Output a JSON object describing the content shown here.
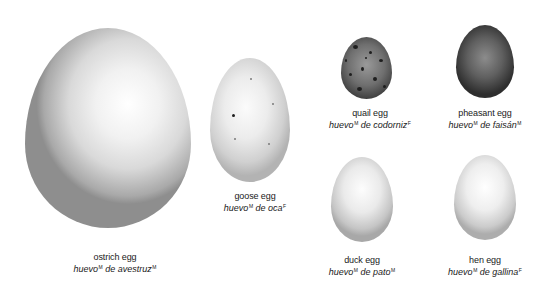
{
  "eggs": [
    {
      "id": "ostrich",
      "en": "ostrich egg",
      "es_noun": "huevo",
      "es_noun_gender": "M",
      "es_rest": " de avestruz",
      "es_rest_gender": "M"
    },
    {
      "id": "goose",
      "en": "goose egg",
      "es_noun": "huevo",
      "es_noun_gender": "M",
      "es_rest": " de oca",
      "es_rest_gender": "F"
    },
    {
      "id": "quail",
      "en": "quail egg",
      "es_noun": "huevo",
      "es_noun_gender": "M",
      "es_rest": " de codorniz",
      "es_rest_gender": "F"
    },
    {
      "id": "pheasant",
      "en": "pheasant egg",
      "es_noun": "huevo",
      "es_noun_gender": "M",
      "es_rest": " de faisán",
      "es_rest_gender": "M"
    },
    {
      "id": "duck",
      "en": "duck egg",
      "es_noun": "huevo",
      "es_noun_gender": "M",
      "es_rest": " de pato",
      "es_rest_gender": "M"
    },
    {
      "id": "hen",
      "en": "hen egg",
      "es_noun": "huevo",
      "es_noun_gender": "M",
      "es_rest": " de gallina",
      "es_rest_gender": "F"
    }
  ],
  "colors": {
    "background": "#ffffff",
    "text": "#1a1a1a"
  }
}
